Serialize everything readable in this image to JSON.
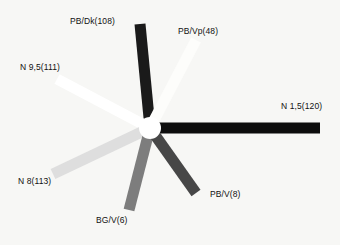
{
  "chart_data": {
    "type": "scatter",
    "title": "",
    "subtitle": "",
    "xlabel": "",
    "ylabel": "",
    "legend_position": "inline-labels",
    "grid": false,
    "background_color": "#f7f7f5",
    "hub": {
      "name": "center-hub",
      "cx": 150,
      "cy": 128,
      "r": 11,
      "color": "#ffffff"
    },
    "categories": [
      "PB/Dk(108)",
      "PB/Vp(48)",
      "N 9,5(111)",
      "N 1,5(120)",
      "N 8(113)",
      "BG/V(6)",
      "PB/V(8)"
    ],
    "values": [
      108,
      48,
      111,
      120,
      113,
      6,
      8
    ],
    "spokes": [
      {
        "id": "pb-dk",
        "label": "PB/Dk(108)",
        "value": 108,
        "color": "#1a1a1a",
        "x1": 150,
        "y1": 128,
        "x2": 140,
        "y2": 24,
        "width": 11,
        "label_x": 70,
        "label_y": 17,
        "label_align": "left"
      },
      {
        "id": "pb-vp",
        "label": "PB/Vp(48)",
        "value": 48,
        "color": "#fdfdfb",
        "x1": 150,
        "y1": 128,
        "x2": 196,
        "y2": 40,
        "width": 11,
        "label_x": 178,
        "label_y": 27,
        "label_align": "left"
      },
      {
        "id": "n-95",
        "label": "N 9,5(111)",
        "value": 111,
        "color": "#ffffff",
        "x1": 150,
        "y1": 128,
        "x2": 57,
        "y2": 79,
        "width": 11,
        "label_x": 20,
        "label_y": 63,
        "label_align": "left"
      },
      {
        "id": "n-15",
        "label": "N 1,5(120)",
        "value": 120,
        "color": "#0d0d0d",
        "x1": 150,
        "y1": 128,
        "x2": 320,
        "y2": 128,
        "width": 11,
        "label_x": 281,
        "label_y": 102,
        "label_align": "left"
      },
      {
        "id": "n-8",
        "label": "N 8(113)",
        "value": 113,
        "color": "#dedede",
        "x1": 150,
        "y1": 128,
        "x2": 53,
        "y2": 174,
        "width": 11,
        "label_x": 18,
        "label_y": 177,
        "label_align": "left"
      },
      {
        "id": "bg-v",
        "label": "BG/V(6)",
        "value": 6,
        "color": "#7d7d7d",
        "x1": 150,
        "y1": 128,
        "x2": 129,
        "y2": 210,
        "width": 11,
        "label_x": 96,
        "label_y": 216,
        "label_align": "left"
      },
      {
        "id": "pb-v",
        "label": "PB/V(8)",
        "value": 8,
        "color": "#474747",
        "x1": 150,
        "y1": 128,
        "x2": 196,
        "y2": 193,
        "width": 11,
        "label_x": 210,
        "label_y": 190,
        "label_align": "left"
      }
    ]
  }
}
